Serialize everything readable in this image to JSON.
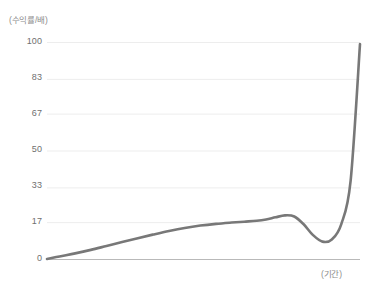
{
  "chart_data": {
    "type": "line",
    "title": "",
    "subtitle": "",
    "xlabel": "(기간)",
    "ylabel": "(수익률/배)",
    "ylim": [
      0,
      100
    ],
    "xlim": [
      0,
      100
    ],
    "grid": true,
    "grid_axis": "y",
    "legend": false,
    "legend_position": "none",
    "yticks": [
      0,
      17,
      33,
      50,
      67,
      83,
      100
    ],
    "ytick_labels": [
      "0",
      "17",
      "33",
      "50",
      "67",
      "83",
      "100"
    ],
    "xticks": [],
    "xtick_labels": [],
    "series": [
      {
        "name": "수익률",
        "color": "#787878",
        "line_width": 2.6,
        "x": [
          0,
          4,
          9,
          14,
          19,
          24,
          29,
          34,
          39,
          44,
          49,
          54,
          59,
          63,
          67,
          70,
          73,
          76,
          79,
          82,
          85,
          88,
          91,
          94,
          97,
          100
        ],
        "values": [
          0,
          1.2,
          2.6,
          4.2,
          6.0,
          7.8,
          9.6,
          11.3,
          12.9,
          14.3,
          15.4,
          16.2,
          16.8,
          17.2,
          17.6,
          18.2,
          19.2,
          20.1,
          19.6,
          16.0,
          11.0,
          8.0,
          9.0,
          16.0,
          36.0,
          99.0
        ]
      }
    ],
    "annotations": {
      "local_peak": {
        "x": 76,
        "value": 20.1
      },
      "trough": {
        "x": 88,
        "value": 8.0
      },
      "end_point": {
        "x": 100,
        "value": 99.0
      }
    },
    "colors": {
      "line": "#787878",
      "grid": "#ededed",
      "axis": "#b9b9b9",
      "tick_label": "#6f6f6f",
      "unit_label": "#8d8d8d",
      "background": "#ffffff"
    }
  },
  "axis": {
    "y_unit_label": "(수익률/배)",
    "x_unit_label": "(기간)",
    "tick_100": "100",
    "tick_83": "83",
    "tick_67": "67",
    "tick_50": "50",
    "tick_33": "33",
    "tick_17": "17",
    "tick_0": "0"
  }
}
